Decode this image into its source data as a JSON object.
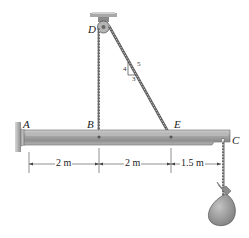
{
  "diagram": {
    "points": {
      "A": {
        "label": "A"
      },
      "B": {
        "label": "B"
      },
      "C": {
        "label": "C"
      },
      "D": {
        "label": "D"
      },
      "E": {
        "label": "E"
      }
    },
    "slope_triangle": {
      "rise": "4",
      "run": "3",
      "hypotenuse": "5"
    },
    "dimensions": [
      {
        "label": "2 m"
      },
      {
        "label": "2 m"
      },
      {
        "label": "1.5 m"
      }
    ],
    "colors": {
      "beam_top": "#b8b8b8",
      "beam_mid": "#9a9a9a",
      "beam_bottom": "#7a7a7a",
      "cable": "#555555",
      "bag": "#9c9c9c",
      "wall": "#a8a8a8"
    }
  }
}
